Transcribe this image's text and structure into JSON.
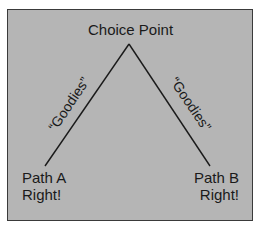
{
  "diagram": {
    "title": "Choice Point",
    "left_branch": {
      "edge_label": "“Goodies”",
      "endpoint_line1": "Path A",
      "endpoint_line2": "Right!"
    },
    "right_branch": {
      "edge_label": "“Goodies”",
      "endpoint_line1": "Path B",
      "endpoint_line2": "Right!"
    },
    "colors": {
      "background": "#b5b5b5",
      "border": "#3a3a3a",
      "text": "#1a1a1a",
      "line": "#1a1a1a"
    }
  }
}
